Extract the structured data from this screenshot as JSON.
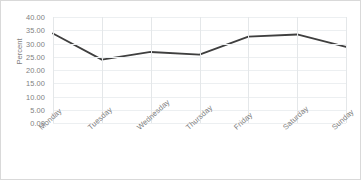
{
  "chart_data": {
    "type": "line",
    "title": "",
    "xlabel": "",
    "ylabel": "Percent",
    "categories": [
      "Monday",
      "Tuesday",
      "Wednesday",
      "Thursday",
      "Friday",
      "Saturday",
      "Sunday"
    ],
    "values": [
      33.8,
      23.9,
      26.8,
      25.8,
      32.6,
      33.4,
      28.7
    ],
    "series": [
      {
        "name": "Percent",
        "values": [
          33.8,
          23.9,
          26.8,
          25.8,
          32.6,
          33.4,
          28.7
        ],
        "color": "#3f3f3f"
      }
    ],
    "ylim": [
      0,
      40
    ],
    "ytick_step": 5,
    "ytick_labels": [
      "40.00",
      "35.00",
      "30.00",
      "25.00",
      "20.00",
      "15.00",
      "10.00",
      "5.00",
      "0.00"
    ],
    "ytick_values": [
      40,
      35,
      30,
      25,
      20,
      15,
      10,
      5,
      0
    ],
    "grid": {
      "horizontal": true,
      "vertical": true,
      "horizontal_color": "#eceff1",
      "vertical_color": "#e4e7e9"
    },
    "legend": {
      "visible": false,
      "position": "none"
    },
    "xtick_rotation": -42,
    "line_color": "#3f3f3f",
    "line_width": 1.8,
    "markers": false,
    "border_color": "#d9d9d9",
    "background": "#ffffff",
    "text_color": "#808080"
  }
}
